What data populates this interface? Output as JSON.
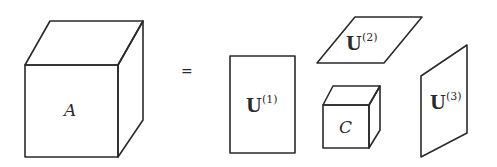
{
  "diagram": {
    "tensor": {
      "label": "A"
    },
    "equals": "=",
    "factors": [
      {
        "base": "U",
        "sup": "(1)"
      },
      {
        "base": "U",
        "sup": "(2)"
      },
      {
        "base": "U",
        "sup": "(3)"
      }
    ],
    "core": {
      "label": "C"
    },
    "colors": {
      "stroke": "#2a2a2a",
      "background": "#ffffff"
    }
  }
}
